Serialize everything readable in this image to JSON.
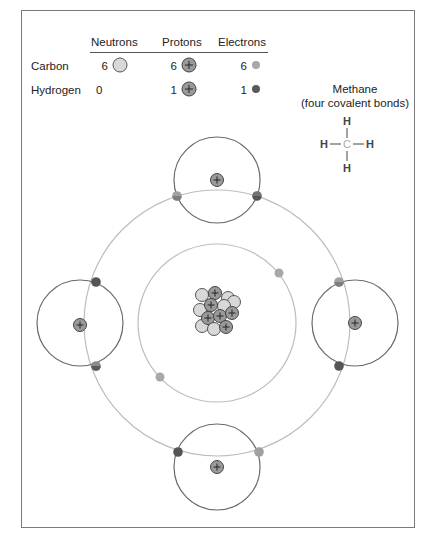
{
  "legend": {
    "headers": [
      "Neutrons",
      "Protons",
      "Electrons"
    ],
    "rows": [
      {
        "label": "Carbon",
        "neutrons": "6",
        "protons": "6",
        "electrons": "6",
        "electron_color": "#a8a8a8"
      },
      {
        "label": "Hydrogen",
        "neutrons": "0",
        "protons": "1",
        "electrons": "1",
        "electron_color": "#5a5a5a"
      }
    ]
  },
  "methane": {
    "title": "Methane",
    "subtitle": "(four covalent bonds)",
    "atoms": {
      "center": "C",
      "top": "H",
      "bottom": "H",
      "left": "H",
      "right": "H"
    }
  },
  "diagram": {
    "center_symbol": "carbon-nucleus",
    "inner_shell_electrons": 2,
    "outer_shell_shared_electrons": 8,
    "hydrogen_atoms": [
      "top",
      "left",
      "right",
      "bottom"
    ]
  },
  "colors": {
    "neutron": "#d8d8d8",
    "proton": "#9a9a9a",
    "carbon_electron": "#a8a8a8",
    "hydrogen_electron": "#5a5a5a",
    "carbon_orbit": "#bdbdbd",
    "hydrogen_orbit": "#6a6a6a"
  }
}
